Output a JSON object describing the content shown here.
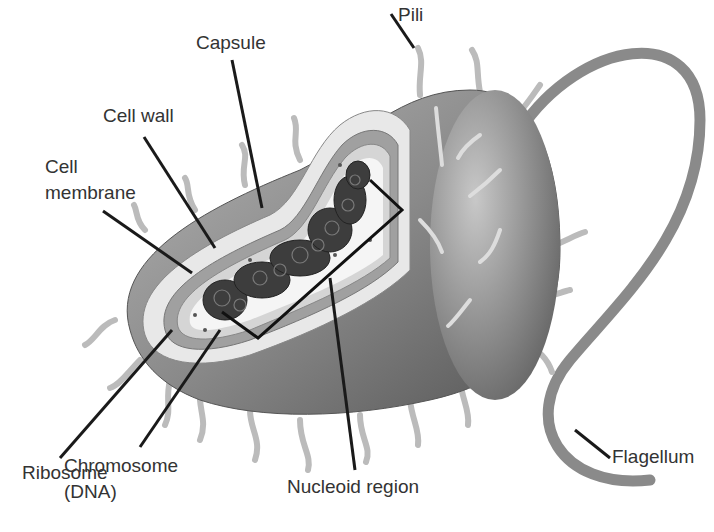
{
  "diagram": {
    "labels": {
      "pili": "Pili",
      "capsule": "Capsule",
      "cell_wall": "Cell wall",
      "cell_membrane_1": "Cell",
      "cell_membrane_2": "membrane",
      "flagellum": "Flagellum",
      "ribosome": "Ribosome",
      "chromosome_1": "Chromosome",
      "chromosome_2": "(DNA)",
      "nucleoid_region": "Nucleoid region"
    },
    "colors": {
      "body_dark": "#5a5a5a",
      "body_light": "#a8a8a8",
      "capsule": "#e6e6e6",
      "wall": "#9a9a9a",
      "cytoplasm": "#f4f4f4",
      "dna": "#3a3a3a",
      "leader": "#1a1a1a",
      "text": "#333333"
    }
  }
}
